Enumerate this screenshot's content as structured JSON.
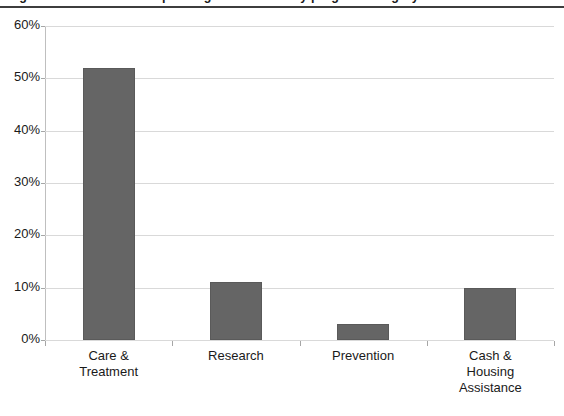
{
  "chart_data": {
    "type": "bar",
    "title": "Figure 1. Distribution of spending on HIV/AIDS by program category",
    "subtitle": "",
    "xlabel": "",
    "ylabel": "",
    "categories": [
      "Care & Treatment",
      "Research",
      "Prevention",
      "Cash & Housing Assistance"
    ],
    "category_lines": [
      [
        "Care &",
        "Treatment"
      ],
      [
        "Research"
      ],
      [
        "Prevention"
      ],
      [
        "Cash &",
        "Housing",
        "Assistance"
      ]
    ],
    "values": [
      52,
      11,
      3,
      10
    ],
    "value_labels": [
      "52%",
      "11%",
      "3%",
      "10%"
    ],
    "ylim": [
      0,
      60
    ],
    "ytick_values": [
      60,
      50,
      40,
      30,
      20,
      10,
      0
    ],
    "ytick_labels": [
      "60%",
      "50%",
      "40%",
      "30%",
      "20%",
      "10%",
      "0%"
    ],
    "grid": true,
    "legend": false,
    "legend_position": "none",
    "bar_color": "#656565",
    "gridline_color": "#d9d9d9",
    "axis_color": "#a6a6a6",
    "background_color": "#ffffff",
    "title_rule_color": "#3d3d3d"
  }
}
